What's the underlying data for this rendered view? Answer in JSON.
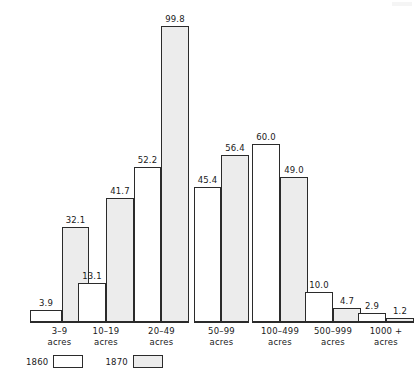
{
  "chart_data": {
    "type": "bar",
    "title": "",
    "subtitle": "",
    "xlabel": "",
    "ylabel": "",
    "grid": false,
    "legend_position": "bottom-left",
    "ylim": [
      0,
      99.8
    ],
    "categories": [
      {
        "range": "3–9",
        "unit": "acres"
      },
      {
        "range": "10–19",
        "unit": "acres"
      },
      {
        "range": "20–49",
        "unit": "acres"
      },
      {
        "range": "50–99",
        "unit": "acres"
      },
      {
        "range": "100–499",
        "unit": "acres"
      },
      {
        "range": "500–999",
        "unit": "acres"
      },
      {
        "range": "1000 +",
        "unit": "acres"
      }
    ],
    "series": [
      {
        "name": "1860",
        "color": "#ffffff",
        "values": [
          3.9,
          13.1,
          52.2,
          45.4,
          60.0,
          10.0,
          2.9
        ],
        "labels": [
          "3.9",
          "13.1",
          "52.2",
          "45.4",
          "60.0",
          "10.0",
          "2.9"
        ]
      },
      {
        "name": "1870",
        "color": "#ececec",
        "values": [
          32.1,
          41.7,
          99.8,
          56.4,
          49.0,
          4.7,
          1.2
        ],
        "labels": [
          "32.1",
          "41.7",
          "99.8",
          "56.4",
          "49.0",
          "4.7",
          "1.2"
        ]
      }
    ]
  },
  "legend": {
    "entries": [
      {
        "label": "1860",
        "swatch": "white-swatch"
      },
      {
        "label": "1870",
        "swatch": "gray-swatch"
      }
    ]
  }
}
